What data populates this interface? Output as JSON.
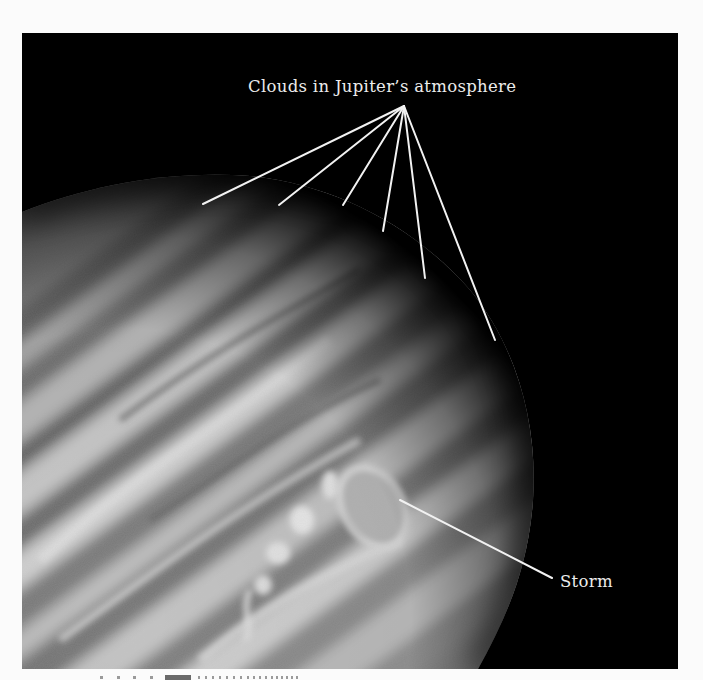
{
  "figure": {
    "subject": "Jupiter",
    "background_color": "#000000",
    "labels": {
      "clouds": "Clouds in Jupiter’s atmosphere",
      "storm": "Storm"
    },
    "label_color": "#ececec",
    "leader_line_color": "#f2f2f2",
    "cloud_leader_line_count": 6,
    "storm_leader_line_count": 1
  }
}
